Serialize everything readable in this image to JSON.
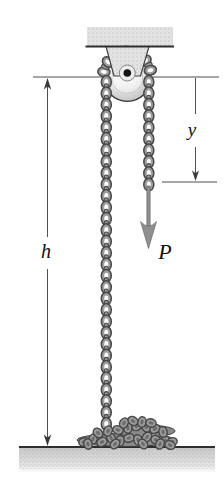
{
  "figure": {
    "labels": {
      "height_dimension": "h",
      "offset_dimension": "y",
      "force": "P"
    },
    "colors": {
      "dimension_line": "#4f4f4f",
      "dimension_arrow": "#3a3a3a",
      "chain_fill": "#9c9c9c",
      "chain_stroke": "#474747",
      "force_arrow_fill": "#8f8f8f",
      "force_arrow_edge": "#5c5c5c",
      "surface_edge": "#2e2e2e",
      "label_text": "#101010",
      "background": "#ffffff"
    }
  }
}
